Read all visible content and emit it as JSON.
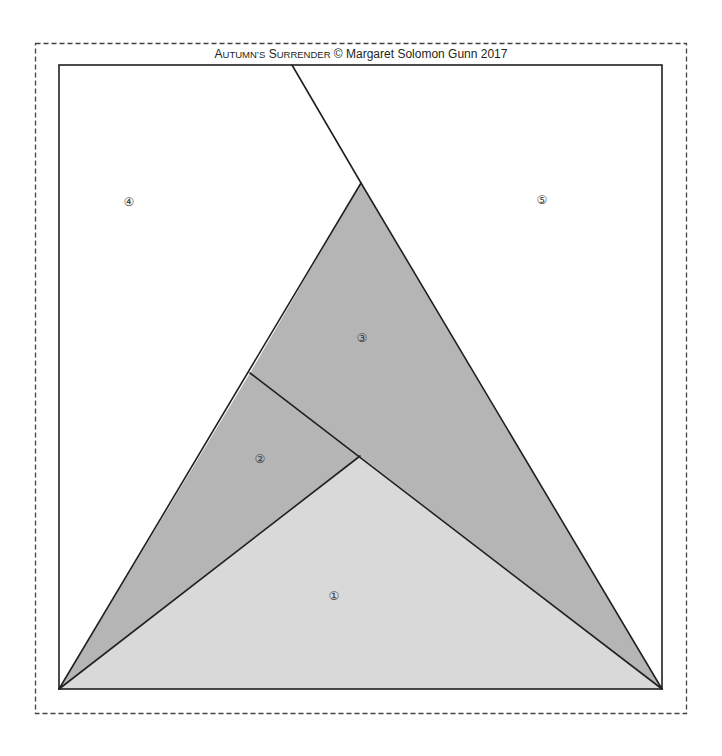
{
  "title": {
    "prefix_cap1": "A",
    "prefix_small1": "UTUMN",
    "prefix_apos": "’",
    "prefix_small2": "S",
    "prefix_space": " ",
    "prefix_cap2": "S",
    "prefix_small3": "URRENDER",
    "rest": " © Margaret Solomon Gunn 2017",
    "full": "Autumn's Surrender © Margaret Solomon Gunn 2017"
  },
  "colors": {
    "background": "#ffffff",
    "line": "#231f20",
    "dashed_border": "#444444",
    "region_1": "#d9d9d9",
    "region_2": "#b5b5b5",
    "region_3": "#b5b5b5",
    "region_4": "#ffffff",
    "region_5": "#ffffff"
  },
  "regions": [
    {
      "id": "1",
      "label": "①",
      "fill": "#d9d9d9",
      "points": "59,689 360,456 662,689",
      "label_x": 334,
      "label_y": 600
    },
    {
      "id": "2",
      "label": "②",
      "fill": "#b5b5b5",
      "points": "59,689 250,373 360,456",
      "label_x": 260,
      "label_y": 463
    },
    {
      "id": "3",
      "label": "③",
      "fill": "#b5b5b5",
      "points": "250,373 361,183 662,689 360,456",
      "label_x": 362,
      "label_y": 342
    },
    {
      "id": "4",
      "label": "④",
      "fill": "#ffffff",
      "points": "59,65 292,65 361,183 59,689",
      "label_x": 129,
      "label_y": 206
    },
    {
      "id": "5",
      "label": "⑤",
      "fill": "#ffffff",
      "points": "292,65 662,65 662,689 361,183",
      "label_x": 542,
      "label_y": 204
    }
  ],
  "labels": {
    "r1": "①",
    "r2": "②",
    "r3": "③",
    "r4": "④",
    "r5": "⑤"
  }
}
